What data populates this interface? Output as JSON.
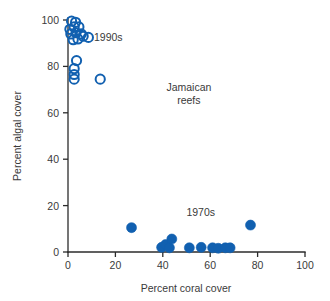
{
  "chart_data": {
    "type": "scatter",
    "title": "",
    "subtitle": "",
    "xlabel": "Percent coral cover",
    "ylabel": "Percent algal cover",
    "xlim": [
      0,
      100
    ],
    "ylim": [
      0,
      100
    ],
    "xticks": [
      0,
      20,
      40,
      60,
      80,
      100
    ],
    "yticks": [
      0,
      20,
      40,
      60,
      80,
      100
    ],
    "xtick_labels": [
      "0",
      "20",
      "40",
      "60",
      "80",
      "100"
    ],
    "ytick_labels": [
      "0",
      "20",
      "40",
      "60",
      "80",
      "100"
    ],
    "grid": false,
    "legend_position": "none",
    "marker_color": "#1160b0",
    "annotations": [
      {
        "text": "1990s",
        "x": 17.0,
        "y": 91.0
      },
      {
        "text": "Jamaican",
        "x": 51.0,
        "y": 69.5
      },
      {
        "text": "reefs",
        "x": 51.0,
        "y": 64.0
      },
      {
        "text": "1970s",
        "x": 56.0,
        "y": 15.5
      }
    ],
    "series": [
      {
        "name": "1990s",
        "marker": "open-circle",
        "color": "#1160b0",
        "points": [
          {
            "x": 1.5,
            "y": 99.5
          },
          {
            "x": 3.2,
            "y": 99.0
          },
          {
            "x": 0.8,
            "y": 96.0
          },
          {
            "x": 2.6,
            "y": 97.0
          },
          {
            "x": 4.6,
            "y": 97.0
          },
          {
            "x": 1.2,
            "y": 94.0
          },
          {
            "x": 3.4,
            "y": 94.5
          },
          {
            "x": 5.6,
            "y": 94.0
          },
          {
            "x": 2.2,
            "y": 91.5
          },
          {
            "x": 4.2,
            "y": 91.8
          },
          {
            "x": 6.4,
            "y": 93.0
          },
          {
            "x": 8.6,
            "y": 92.5
          },
          {
            "x": 3.6,
            "y": 82.5
          },
          {
            "x": 2.6,
            "y": 79.0
          },
          {
            "x": 2.6,
            "y": 76.5
          },
          {
            "x": 2.6,
            "y": 74.5
          },
          {
            "x": 13.6,
            "y": 74.5
          }
        ]
      },
      {
        "name": "1970s",
        "marker": "filled-circle",
        "color": "#1160b0",
        "points": [
          {
            "x": 26.8,
            "y": 10.5
          },
          {
            "x": 39.5,
            "y": 2.0
          },
          {
            "x": 41.2,
            "y": 3.2
          },
          {
            "x": 42.8,
            "y": 1.8
          },
          {
            "x": 43.8,
            "y": 5.6
          },
          {
            "x": 51.2,
            "y": 1.8
          },
          {
            "x": 56.2,
            "y": 2.0
          },
          {
            "x": 61.0,
            "y": 1.8
          },
          {
            "x": 63.4,
            "y": 1.6
          },
          {
            "x": 66.4,
            "y": 1.8
          },
          {
            "x": 68.4,
            "y": 1.8
          },
          {
            "x": 77.0,
            "y": 11.6
          }
        ]
      }
    ]
  },
  "axes": {
    "x_title": "Percent coral cover",
    "y_title": "Percent algal cover"
  }
}
